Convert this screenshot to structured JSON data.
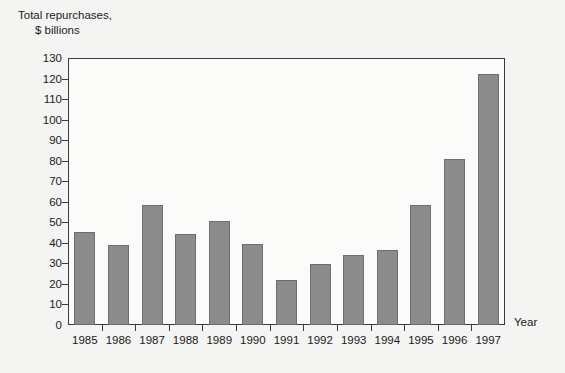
{
  "chart_data": {
    "type": "bar",
    "title": "Total repurchases, $ billions",
    "title_line1": "Total repurchases,",
    "title_line2": "$ billions",
    "xlabel": "Year",
    "ylabel": "Total repurchases, $ billions",
    "categories": [
      "1985",
      "1986",
      "1987",
      "1988",
      "1989",
      "1990",
      "1991",
      "1992",
      "1993",
      "1994",
      "1995",
      "1996",
      "1997"
    ],
    "values": [
      45.5,
      39,
      58.5,
      44.5,
      50.5,
      39.5,
      22,
      29.5,
      34,
      36.5,
      58.5,
      81,
      122
    ],
    "ylim": [
      0,
      130
    ],
    "ytick_values": [
      0,
      10,
      20,
      30,
      40,
      50,
      60,
      70,
      80,
      90,
      100,
      110,
      120,
      130
    ],
    "ytick_labels": [
      "0",
      "10",
      "20",
      "30",
      "40",
      "50",
      "60",
      "70",
      "80",
      "90",
      "100",
      "110",
      "120",
      "130"
    ],
    "grid": false,
    "legend": null,
    "bar_color": "#8c8c8c",
    "bar_border_color": "#6d6d6d",
    "axis_color": "#3a3a3a",
    "plot_background": "#fbfbfa",
    "figure_background": "#f4f4f3"
  }
}
